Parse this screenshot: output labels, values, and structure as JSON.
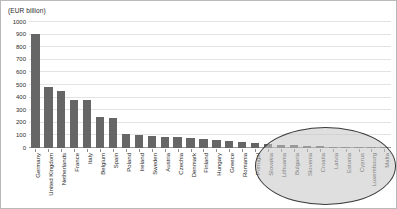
{
  "chart_data": {
    "type": "bar",
    "title": "(EUR billion)",
    "xlabel": "",
    "ylabel": "",
    "ylim": [
      0,
      1000
    ],
    "yticks": [
      0,
      100,
      200,
      300,
      400,
      500,
      600,
      700,
      800,
      900,
      1000
    ],
    "grid": true,
    "legend": false,
    "bar_color": "#666666",
    "categories": [
      "Germany",
      "United Kingdom",
      "Netherlands",
      "France",
      "Italy",
      "Belgium",
      "Spain",
      "Poland",
      "Ireland",
      "Sweden",
      "Austria",
      "Czechia",
      "Denmark",
      "Finland",
      "Hungary",
      "Greece",
      "Romania",
      "Portugal",
      "Slovakia",
      "Lithuania",
      "Bulgaria",
      "Slovenia",
      "Croatia",
      "Latvia",
      "Estonia",
      "Cyprus",
      "Luxembourg",
      "Malta"
    ],
    "values": [
      905,
      485,
      450,
      380,
      378,
      245,
      238,
      115,
      100,
      95,
      88,
      85,
      78,
      72,
      62,
      55,
      48,
      40,
      28,
      24,
      21,
      17,
      15,
      12,
      10,
      7,
      5,
      3
    ],
    "annotations": [
      {
        "name": "small-countries-ellipse",
        "shape": "ellipse",
        "covers": [
          "Slovakia",
          "Lithuania",
          "Bulgaria",
          "Slovenia",
          "Croatia",
          "Latvia",
          "Estonia",
          "Cyprus",
          "Luxembourg",
          "Malta"
        ]
      }
    ]
  }
}
